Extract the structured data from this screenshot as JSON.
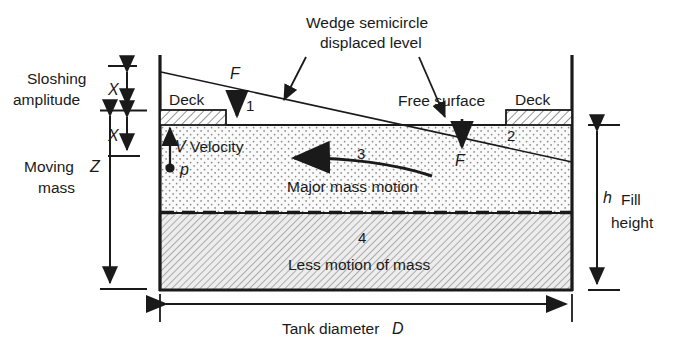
{
  "diagram": {
    "title_annotation": {
      "line1": "Wedge semicircle",
      "line2": "displaced level"
    },
    "labels": {
      "sloshing_line1": "Sloshing",
      "sloshing_line2": "amplitude",
      "moving_line1": "Moving",
      "moving_line2": "mass",
      "deck_left": "Deck",
      "deck_right": "Deck",
      "free_surface": "Free surface",
      "velocity": "Velocity",
      "major_mass_motion": "Major mass motion",
      "less_motion": "Less motion of mass",
      "fill_height_word1": "Fill",
      "fill_height_word2": "height",
      "tank_diameter": "Tank diameter"
    },
    "symbols": {
      "x_upper": "X",
      "x_lower": "X",
      "z": "Z",
      "v": "V",
      "p": "p",
      "h": "h",
      "d": "D",
      "f_left": "F",
      "f_right": "F"
    },
    "region_numbers": {
      "one": "1",
      "two": "2",
      "three": "3",
      "four": "4"
    },
    "colors": {
      "ink": "#1a1a1a",
      "upper_fluid_fill": "#f4f4f4",
      "lower_fluid_fill": "#e8e8e8",
      "deck_fill": "#fdfdfd",
      "background": "#ffffff"
    }
  }
}
